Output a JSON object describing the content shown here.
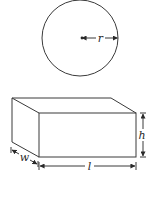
{
  "diagram": {
    "circle": {
      "label": "r",
      "center": [
        80,
        38
      ],
      "radius": 38
    },
    "box": {
      "labels": {
        "height": "h",
        "width": "w",
        "length": "l"
      }
    }
  },
  "colors": {
    "line": "#3a3a3a",
    "background": "#ffffff"
  }
}
